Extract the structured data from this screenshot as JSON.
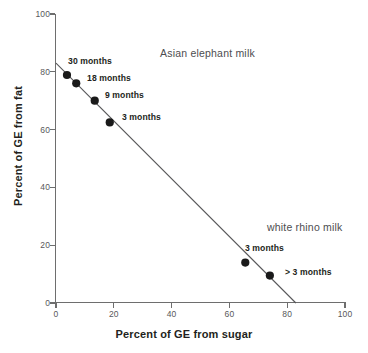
{
  "chart_data": {
    "type": "scatter",
    "title": "",
    "xlabel": "Percent of GE from sugar",
    "ylabel": "Percent of GE from fat",
    "xlim": [
      0,
      100
    ],
    "ylim": [
      0,
      100
    ],
    "xticks": [
      "0",
      "20",
      "40",
      "60",
      "80",
      "100"
    ],
    "yticks": [
      "0",
      "20",
      "40",
      "60",
      "80",
      "100"
    ],
    "xtick_values": [
      0,
      20,
      40,
      60,
      80,
      100
    ],
    "ytick_values": [
      0,
      20,
      40,
      60,
      80,
      100
    ],
    "grid": false,
    "legend": "none",
    "series": [
      {
        "name": "Asian elephant milk",
        "points": [
          {
            "label": "30 months",
            "x": 3.8,
            "y": 78.9
          },
          {
            "label": "18 months",
            "x": 7.0,
            "y": 76.0
          },
          {
            "label": "9 months",
            "x": 13.4,
            "y": 70.0
          },
          {
            "label": "3 months",
            "x": 18.6,
            "y": 62.5
          }
        ]
      },
      {
        "name": "white rhino milk",
        "points": [
          {
            "label": "3 months",
            "x": 65.5,
            "y": 14.0
          },
          {
            "label": "> 3 months",
            "x": 74.0,
            "y": 9.5
          }
        ]
      }
    ],
    "trendline": {
      "x0": 0,
      "y0": 83.0,
      "x1": 83.0,
      "y1": 0
    },
    "annotations": [
      {
        "name": "asian-elephant-milk-label",
        "text": "Asian elephant milk",
        "x": 36,
        "y": 86
      },
      {
        "name": "white-rhino-milk-label",
        "text": "white rhino milk",
        "x": 73,
        "y": 26
      }
    ],
    "point_labels": [
      {
        "text": "30 months",
        "left": 68,
        "top": 56
      },
      {
        "text": "18 months",
        "left": 87,
        "top": 73
      },
      {
        "text": "9 months",
        "left": 105,
        "top": 90
      },
      {
        "text": "3 months",
        "left": 122,
        "top": 112
      },
      {
        "text": "3 months",
        "left": 245,
        "top": 243
      },
      {
        "text": "> 3 months",
        "left": 285,
        "top": 267
      }
    ],
    "colors": {
      "marker": "#1a1a1a",
      "trendline": "#58585a",
      "axis": "#6e6e6e",
      "text": "#231f20",
      "annotation": "#4d4d4f",
      "background": "#ffffff"
    }
  }
}
